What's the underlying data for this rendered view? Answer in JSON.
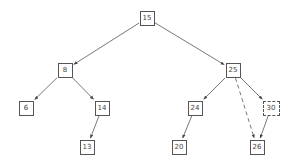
{
  "diagram": {
    "type": "binary-tree",
    "nodes": [
      {
        "id": "n15",
        "label": "15",
        "x": 147,
        "y": 18,
        "style": "solid"
      },
      {
        "id": "n8",
        "label": "8",
        "x": 65,
        "y": 70,
        "style": "solid"
      },
      {
        "id": "n25",
        "label": "25",
        "x": 233,
        "y": 70,
        "style": "solid"
      },
      {
        "id": "n6",
        "label": "6",
        "x": 26,
        "y": 108,
        "style": "solid"
      },
      {
        "id": "n14",
        "label": "14",
        "x": 102,
        "y": 108,
        "style": "solid"
      },
      {
        "id": "n24",
        "label": "24",
        "x": 195,
        "y": 108,
        "style": "solid"
      },
      {
        "id": "n30",
        "label": "30",
        "x": 271,
        "y": 108,
        "style": "dashed"
      },
      {
        "id": "n13",
        "label": "13",
        "x": 87,
        "y": 147,
        "style": "solid"
      },
      {
        "id": "n20",
        "label": "20",
        "x": 179,
        "y": 147,
        "style": "solid"
      },
      {
        "id": "n26",
        "label": "26",
        "x": 257,
        "y": 147,
        "style": "solid"
      }
    ],
    "edges": [
      {
        "from": "n15",
        "to": "n8",
        "style": "solid"
      },
      {
        "from": "n15",
        "to": "n25",
        "style": "solid"
      },
      {
        "from": "n8",
        "to": "n6",
        "style": "solid"
      },
      {
        "from": "n8",
        "to": "n14",
        "style": "solid"
      },
      {
        "from": "n14",
        "to": "n13",
        "style": "solid"
      },
      {
        "from": "n25",
        "to": "n24",
        "style": "solid"
      },
      {
        "from": "n25",
        "to": "n30",
        "style": "solid"
      },
      {
        "from": "n25",
        "to": "n26",
        "style": "dashed"
      },
      {
        "from": "n24",
        "to": "n20",
        "style": "solid"
      },
      {
        "from": "n30",
        "to": "n26",
        "style": "solid"
      }
    ]
  }
}
